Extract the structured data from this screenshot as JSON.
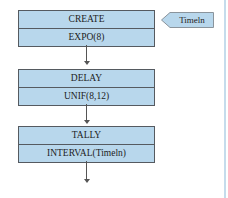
{
  "diagram": {
    "blocks": [
      {
        "name": "CREATE",
        "operand": "EXPO(8)"
      },
      {
        "name": "DELAY",
        "operand": "UNIF(8,12)"
      },
      {
        "name": "TALLY",
        "operand": "INTERVAL(Timeln)"
      }
    ],
    "attribute_tag": {
      "label": "Timeln"
    }
  },
  "colors": {
    "block_fill": "#b8d7ec",
    "block_border": "#555a60",
    "side_rule": "#c5dcec"
  }
}
